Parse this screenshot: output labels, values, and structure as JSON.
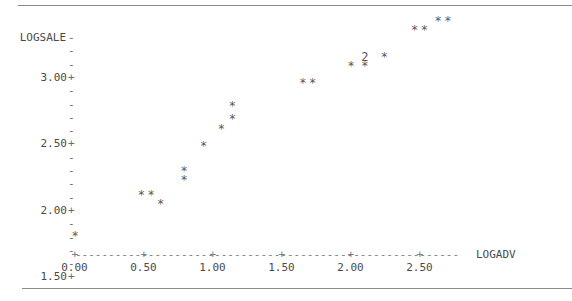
{
  "chart_data": {
    "type": "scatter",
    "title": "",
    "subtitle": "",
    "xlabel": "LOGADV",
    "ylabel": "LOGSALE",
    "grid": false,
    "legend": null,
    "style": "character-cell ASCII scatter plot (Minitab style)",
    "marker": "*",
    "overplot_marker_note": "digit '2' marks a cell containing 2 coincident points",
    "xlim": [
      0.0,
      2.8
    ],
    "ylim": [
      1.5,
      3.3
    ],
    "xticks": [
      0.0,
      0.5,
      1.0,
      1.5,
      2.0,
      2.5
    ],
    "xtick_labels": [
      "0.00",
      "0.50",
      "1.00",
      "1.50",
      "2.00",
      "2.50"
    ],
    "yticks": [
      1.5,
      2.0,
      2.5,
      3.0
    ],
    "ytick_labels": [
      "1.50+",
      "2.00+",
      "2.50+",
      "3.00+"
    ],
    "points": [
      {
        "x": 0.0,
        "y": 1.55,
        "count": 1
      },
      {
        "x": 0.48,
        "y": 1.86,
        "count": 1
      },
      {
        "x": 0.55,
        "y": 1.86,
        "count": 1
      },
      {
        "x": 0.62,
        "y": 1.79,
        "count": 1
      },
      {
        "x": 0.79,
        "y": 1.97,
        "count": 1
      },
      {
        "x": 0.79,
        "y": 2.04,
        "count": 1
      },
      {
        "x": 0.93,
        "y": 2.23,
        "count": 1
      },
      {
        "x": 1.06,
        "y": 2.36,
        "count": 1
      },
      {
        "x": 1.14,
        "y": 2.43,
        "count": 1
      },
      {
        "x": 1.14,
        "y": 2.53,
        "count": 1
      },
      {
        "x": 1.65,
        "y": 2.7,
        "count": 1
      },
      {
        "x": 1.72,
        "y": 2.7,
        "count": 1
      },
      {
        "x": 2.0,
        "y": 2.83,
        "count": 1
      },
      {
        "x": 2.1,
        "y": 2.83,
        "count": 1
      },
      {
        "x": 2.1,
        "y": 2.9,
        "count": 2
      },
      {
        "x": 2.24,
        "y": 2.9,
        "count": 1
      },
      {
        "x": 2.46,
        "y": 3.1,
        "count": 1
      },
      {
        "x": 2.53,
        "y": 3.1,
        "count": 1
      },
      {
        "x": 2.63,
        "y": 3.17,
        "count": 1
      },
      {
        "x": 2.7,
        "y": 3.17,
        "count": 1
      }
    ],
    "n_points": 21
  },
  "axes": {
    "y_axis_name": "LOGSALE",
    "y_axis_name_tick": "-",
    "x_axis_name": "LOGADV",
    "y_rows": [
      {
        "label": "LOGSALE",
        "mark": "-"
      },
      {
        "label": "",
        "mark": "-"
      },
      {
        "label": "",
        "mark": "-"
      },
      {
        "label": "3.00",
        "mark": "+"
      },
      {
        "label": "",
        "mark": "-"
      },
      {
        "label": "",
        "mark": "-"
      },
      {
        "label": "",
        "mark": "-"
      },
      {
        "label": "",
        "mark": "-"
      },
      {
        "label": "2.50",
        "mark": "+"
      },
      {
        "label": "",
        "mark": "-"
      },
      {
        "label": "",
        "mark": "-"
      },
      {
        "label": "",
        "mark": "-"
      },
      {
        "label": "",
        "mark": "-"
      },
      {
        "label": "2.00",
        "mark": "+"
      },
      {
        "label": "",
        "mark": "-"
      },
      {
        "label": "",
        "mark": "-"
      },
      {
        "label": "",
        "mark": "-"
      },
      {
        "label": "",
        "mark": "-"
      },
      {
        "label": "1.50",
        "mark": "+"
      }
    ],
    "x_tick_labels": [
      "0.00",
      "0.50",
      "1.00",
      "1.50",
      "2.00",
      "2.50"
    ],
    "x_axis_line": "+---------+---------+---------+---------+---------+------"
  },
  "colors": {
    "background": "#ffffff",
    "text": "#4a4a4a",
    "marker": "#585858",
    "rule": "#8b8b8b",
    "axis": "#7d7d7d"
  }
}
